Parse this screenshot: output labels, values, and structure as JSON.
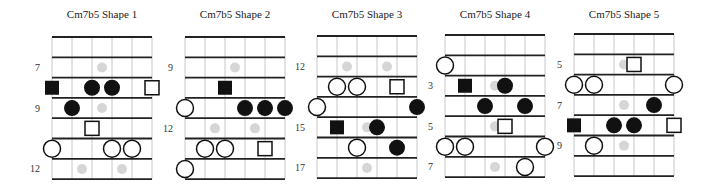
{
  "chord": "Cm7b5",
  "colors": {
    "fret_line": "#222222",
    "string_line": "#c8c8c8",
    "filled": "#111111",
    "open_stroke": "#111111",
    "open_fill": "#ffffff",
    "inlay": "#d6d6d6",
    "text": "#222222"
  },
  "legend_semantics": {
    "black-square": "root (filled)",
    "black-circle": "chord tone (filled)",
    "white-square": "root (alternate position)",
    "white-circle": "chord tone (alternate position)",
    "grey-dot": "fretboard inlay marker"
  },
  "diagrams": [
    {
      "title": "Cm7b5 Shape 1",
      "x0": 52,
      "y0": 37,
      "fret_labels": [
        {
          "row": 1,
          "text": "7"
        },
        {
          "row": 3,
          "text": "9"
        },
        {
          "row": 6,
          "text": "12"
        }
      ],
      "inlays": [
        {
          "row": 1,
          "pos": "center"
        },
        {
          "row": 3,
          "pos": "center"
        },
        {
          "row": 6,
          "pos": "double"
        }
      ],
      "markers": [
        {
          "row": 2,
          "string": 0,
          "type": "black-square"
        },
        {
          "row": 2,
          "string": 2,
          "type": "black-circle"
        },
        {
          "row": 2,
          "string": 3,
          "type": "black-circle"
        },
        {
          "row": 2,
          "string": 5,
          "type": "white-square"
        },
        {
          "row": 3,
          "string": 1,
          "type": "black-circle"
        },
        {
          "row": 4,
          "string": 2,
          "type": "white-square"
        },
        {
          "row": 5,
          "string": 0,
          "type": "white-circle"
        },
        {
          "row": 5,
          "string": 3,
          "type": "white-circle"
        },
        {
          "row": 5,
          "string": 4,
          "type": "white-circle"
        }
      ]
    },
    {
      "title": "Cm7b5 Shape 2",
      "x0": 185,
      "y0": 37,
      "fret_labels": [
        {
          "row": 1,
          "text": "9"
        },
        {
          "row": 4,
          "text": "12"
        }
      ],
      "inlays": [
        {
          "row": 1,
          "pos": "center"
        },
        {
          "row": 4,
          "pos": "double"
        }
      ],
      "markers": [
        {
          "row": 2,
          "string": 2,
          "type": "black-square"
        },
        {
          "row": 3,
          "string": 0,
          "type": "white-circle"
        },
        {
          "row": 3,
          "string": 3,
          "type": "black-circle"
        },
        {
          "row": 3,
          "string": 4,
          "type": "black-circle"
        },
        {
          "row": 3,
          "string": 5,
          "type": "black-circle"
        },
        {
          "row": 5,
          "string": 1,
          "type": "white-circle"
        },
        {
          "row": 5,
          "string": 2,
          "type": "white-circle"
        },
        {
          "row": 5,
          "string": 4,
          "type": "white-square"
        },
        {
          "row": 6,
          "string": 0,
          "type": "white-circle"
        }
      ]
    },
    {
      "title": "Cm7b5 Shape 3",
      "x0": 317,
      "y0": 36,
      "fret_labels": [
        {
          "row": 1,
          "text": "12"
        },
        {
          "row": 4,
          "text": "15"
        },
        {
          "row": 6,
          "text": "17"
        }
      ],
      "inlays": [
        {
          "row": 1,
          "pos": "double"
        },
        {
          "row": 4,
          "pos": "center"
        },
        {
          "row": 6,
          "pos": "center"
        }
      ],
      "markers": [
        {
          "row": 2,
          "string": 1,
          "type": "white-circle"
        },
        {
          "row": 2,
          "string": 2,
          "type": "white-circle"
        },
        {
          "row": 2,
          "string": 4,
          "type": "white-square"
        },
        {
          "row": 3,
          "string": 0,
          "type": "white-circle"
        },
        {
          "row": 3,
          "string": 5,
          "type": "black-circle"
        },
        {
          "row": 4,
          "string": 1,
          "type": "black-square"
        },
        {
          "row": 4,
          "string": 3,
          "type": "black-circle"
        },
        {
          "row": 5,
          "string": 2,
          "type": "white-circle"
        },
        {
          "row": 5,
          "string": 4,
          "type": "black-circle"
        }
      ]
    },
    {
      "title": "Cm7b5 Shape 4",
      "x0": 445,
      "y0": 35,
      "fret_labels": [
        {
          "row": 2,
          "text": "3"
        },
        {
          "row": 4,
          "text": "5"
        },
        {
          "row": 6,
          "text": "7"
        }
      ],
      "inlays": [
        {
          "row": 2,
          "pos": "center"
        },
        {
          "row": 4,
          "pos": "center"
        },
        {
          "row": 6,
          "pos": "center"
        }
      ],
      "markers": [
        {
          "row": 1,
          "string": 0,
          "type": "white-circle"
        },
        {
          "row": 2,
          "string": 1,
          "type": "black-square"
        },
        {
          "row": 2,
          "string": 3,
          "type": "black-circle"
        },
        {
          "row": 3,
          "string": 2,
          "type": "black-circle"
        },
        {
          "row": 3,
          "string": 4,
          "type": "black-circle"
        },
        {
          "row": 4,
          "string": 3,
          "type": "white-square"
        },
        {
          "row": 5,
          "string": 0,
          "type": "white-circle"
        },
        {
          "row": 5,
          "string": 1,
          "type": "white-circle"
        },
        {
          "row": 5,
          "string": 5,
          "type": "white-circle"
        },
        {
          "row": 6,
          "string": 4,
          "type": "white-circle"
        }
      ]
    },
    {
      "title": "Cm7b5 Shape 5",
      "x0": 574,
      "y0": 34,
      "fret_labels": [
        {
          "row": 1,
          "text": "5"
        },
        {
          "row": 3,
          "text": "7"
        },
        {
          "row": 5,
          "text": "9"
        }
      ],
      "inlays": [
        {
          "row": 1,
          "pos": "center"
        },
        {
          "row": 3,
          "pos": "center"
        },
        {
          "row": 5,
          "pos": "center"
        }
      ],
      "markers": [
        {
          "row": 1,
          "string": 3,
          "type": "white-square"
        },
        {
          "row": 2,
          "string": 0,
          "type": "white-circle"
        },
        {
          "row": 2,
          "string": 1,
          "type": "white-circle"
        },
        {
          "row": 2,
          "string": 5,
          "type": "white-circle"
        },
        {
          "row": 3,
          "string": 4,
          "type": "black-circle"
        },
        {
          "row": 4,
          "string": 0,
          "type": "black-square"
        },
        {
          "row": 4,
          "string": 2,
          "type": "black-circle"
        },
        {
          "row": 4,
          "string": 3,
          "type": "black-circle"
        },
        {
          "row": 4,
          "string": 5,
          "type": "white-square"
        },
        {
          "row": 5,
          "string": 1,
          "type": "white-circle"
        }
      ]
    }
  ],
  "geometry": {
    "strings": 6,
    "rows": 7,
    "string_spacing": 20,
    "fret_spacing": 20.3,
    "title_y": 18,
    "label_offset": 12
  }
}
